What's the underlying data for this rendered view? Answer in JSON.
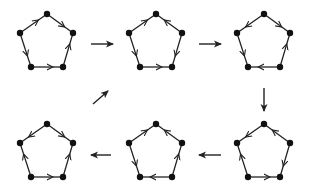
{
  "diagram": {
    "colors": {
      "stroke": "#222222",
      "vertex": "#111111",
      "background": "#ffffff"
    },
    "vertex_labels": [
      "top",
      "right",
      "bottom-right",
      "bottom-left",
      "left"
    ],
    "panels": [
      {
        "id": 1,
        "cx": 47,
        "cy": 42,
        "edges": [
          [
            "left",
            "top"
          ],
          [
            "top",
            "right"
          ],
          [
            "bottom-right",
            "right"
          ],
          [
            "left",
            "bottom-left"
          ],
          [
            "bottom-left",
            "bottom-right"
          ]
        ]
      },
      {
        "id": 2,
        "cx": 156,
        "cy": 42,
        "edges": [
          [
            "left",
            "top"
          ],
          [
            "right",
            "top"
          ],
          [
            "left",
            "bottom-left"
          ],
          [
            "bottom-left",
            "bottom-right"
          ],
          [
            "right",
            "bottom-right"
          ]
        ]
      },
      {
        "id": 3,
        "cx": 264,
        "cy": 42,
        "edges": [
          [
            "top",
            "left"
          ],
          [
            "top",
            "right"
          ],
          [
            "left",
            "bottom-left"
          ],
          [
            "bottom-right",
            "bottom-left"
          ],
          [
            "bottom-right",
            "right"
          ]
        ]
      },
      {
        "id": 4,
        "cx": 47,
        "cy": 152,
        "edges": [
          [
            "top",
            "left"
          ],
          [
            "top",
            "right"
          ],
          [
            "bottom-left",
            "left"
          ],
          [
            "bottom-left",
            "bottom-right"
          ],
          [
            "bottom-right",
            "right"
          ]
        ]
      },
      {
        "id": 5,
        "cx": 156,
        "cy": 152,
        "edges": [
          [
            "left",
            "top"
          ],
          [
            "right",
            "top"
          ],
          [
            "left",
            "bottom-left"
          ],
          [
            "bottom-right",
            "bottom-left"
          ],
          [
            "bottom-right",
            "right"
          ]
        ]
      },
      {
        "id": 6,
        "cx": 264,
        "cy": 152,
        "edges": [
          [
            "top",
            "left"
          ],
          [
            "right",
            "top"
          ],
          [
            "bottom-left",
            "left"
          ],
          [
            "bottom-left",
            "bottom-right"
          ],
          [
            "right",
            "bottom-right"
          ]
        ]
      }
    ],
    "transitions": [
      {
        "from": 1,
        "to": 2,
        "x1": 91,
        "y1": 44,
        "x2": 113,
        "y2": 44
      },
      {
        "from": 2,
        "to": 3,
        "x1": 199,
        "y1": 44,
        "x2": 221,
        "y2": 44
      },
      {
        "from": 3,
        "to": 6,
        "x1": 264,
        "y1": 88,
        "x2": 264,
        "y2": 111
      },
      {
        "from": 6,
        "to": 5,
        "x1": 221,
        "y1": 155,
        "x2": 199,
        "y2": 155
      },
      {
        "from": 5,
        "to": 4,
        "x1": 111,
        "y1": 155,
        "x2": 91,
        "y2": 155
      },
      {
        "from": 4,
        "to": 1,
        "x1": 93,
        "y1": 104,
        "x2": 108,
        "y2": 91
      }
    ]
  }
}
